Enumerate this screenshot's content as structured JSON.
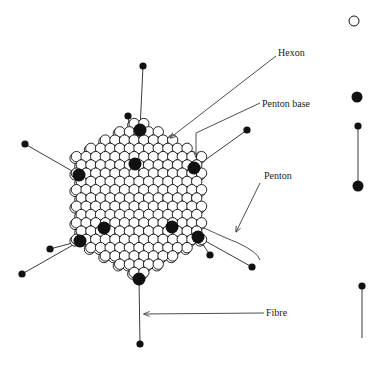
{
  "diagram": {
    "colors": {
      "ink": "#111111",
      "line": "#3a3a3a",
      "fill_open": "#ffffff",
      "background": "#ffffff"
    },
    "capsid": {
      "center": [
        139,
        198
      ],
      "hexon_radius": 5.2,
      "penton_base_radius": 6.5,
      "penton_bases": [
        [
          140,
          130
        ],
        [
          135,
          164
        ],
        [
          194,
          168
        ],
        [
          79,
          175
        ],
        [
          104,
          228
        ],
        [
          172,
          227
        ],
        [
          80,
          241
        ],
        [
          198,
          237
        ],
        [
          139,
          279
        ]
      ]
    },
    "fibres": [
      {
        "from": [
          140,
          130
        ],
        "to": [
          143,
          66
        ]
      },
      {
        "from": [
          135,
          164
        ],
        "to": [
          128,
          116
        ]
      },
      {
        "from": [
          194,
          168
        ],
        "to": [
          247,
          130
        ]
      },
      {
        "from": [
          79,
          175
        ],
        "to": [
          25,
          144
        ]
      },
      {
        "from": [
          80,
          241
        ],
        "to": [
          50,
          249
        ]
      },
      {
        "from": [
          80,
          241
        ],
        "to": [
          22,
          274
        ]
      },
      {
        "from": [
          198,
          237
        ],
        "to": [
          210,
          255
        ]
      },
      {
        "from": [
          198,
          237
        ],
        "to": [
          252,
          267
        ]
      },
      {
        "from": [
          139,
          279
        ],
        "to": [
          140,
          344
        ]
      }
    ],
    "labels": [
      {
        "id": "hexon",
        "text": "Hexon",
        "x": 278,
        "y": 48
      },
      {
        "id": "penton-base",
        "text": "Penton base",
        "x": 262,
        "y": 99
      },
      {
        "id": "penton",
        "text": "Penton",
        "x": 264,
        "y": 171
      },
      {
        "id": "fibre",
        "text": "Fibre",
        "x": 266,
        "y": 308
      }
    ],
    "leaders": [
      {
        "id": "hexon-leader",
        "points": [
          [
            276,
            56
          ],
          [
            170,
            138
          ]
        ],
        "arrow": true
      },
      {
        "id": "penton-base-leader",
        "points": [
          [
            260,
            103
          ],
          [
            196,
            133
          ],
          [
            196,
            157
          ]
        ],
        "arrow": true
      },
      {
        "id": "penton-leader",
        "points": [
          [
            260,
            183
          ],
          [
            236,
            232
          ]
        ],
        "arrow": true
      },
      {
        "id": "fibre-leader",
        "points": [
          [
            264,
            313
          ],
          [
            144,
            314
          ]
        ],
        "arrow": true
      }
    ],
    "penton_bracket": {
      "points": [
        [
          204,
          228
        ],
        [
          230,
          240
        ],
        [
          236,
          242
        ],
        [
          258,
          252
        ],
        [
          260,
          260
        ]
      ]
    },
    "legend": [
      {
        "id": "hexon-symbol",
        "type": "open-circle",
        "cx": 354,
        "cy": 21,
        "r": 5
      },
      {
        "id": "penton-base-symbol",
        "type": "filled-circle",
        "cx": 357,
        "cy": 97,
        "r": 5.5
      },
      {
        "id": "penton-symbol",
        "type": "penton",
        "x": 358,
        "top": 126,
        "bottom": 186,
        "knob_r": 3.6,
        "base_r": 5.5
      },
      {
        "id": "fibre-symbol",
        "type": "fibre",
        "x": 362,
        "top": 286,
        "bottom": 338,
        "knob_r": 3.6
      }
    ]
  }
}
